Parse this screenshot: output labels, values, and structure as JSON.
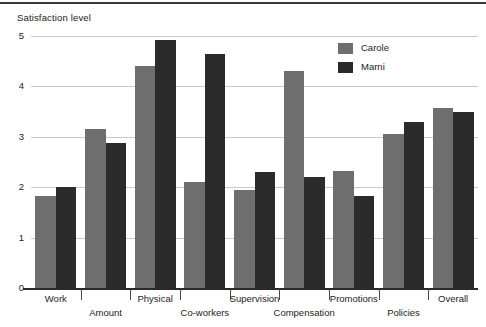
{
  "chart_data": {
    "type": "bar",
    "title": "",
    "ylabel": "Satisfaction level",
    "xlabel": "",
    "ylim": [
      0,
      5
    ],
    "yticks": [
      0,
      1,
      2,
      3,
      4,
      5
    ],
    "ytick_labels": [
      "0",
      "1",
      "2",
      "3",
      "4",
      "5"
    ],
    "grid": true,
    "legend_position": "top-right",
    "categories": [
      "Work",
      "Amount",
      "Physical",
      "Co-workers",
      "Supervision",
      "Compensation",
      "Promotions",
      "Policies",
      "Overall"
    ],
    "series": [
      {
        "name": "Carole",
        "color": "#6e6e6e",
        "values": [
          1.82,
          3.15,
          4.4,
          2.1,
          1.95,
          4.3,
          2.32,
          3.05,
          3.58
        ]
      },
      {
        "name": "Marni",
        "color": "#2b2b2b",
        "values": [
          2.0,
          2.88,
          4.92,
          4.65,
          2.3,
          2.2,
          1.83,
          3.3,
          3.5
        ]
      }
    ]
  },
  "legend": {
    "entries": [
      {
        "label": "Carole",
        "swatch": "legend-swatch-carole"
      },
      {
        "label": "Marni",
        "swatch": "legend-swatch-marni"
      }
    ]
  }
}
